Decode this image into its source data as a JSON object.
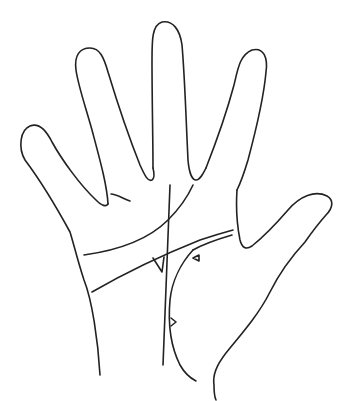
{
  "figure": {
    "title": "Palm lines diagram",
    "width": 347,
    "height": 401,
    "background_color": "#ffffff",
    "stroke_color": "#222222"
  },
  "hand_outline": {
    "little_finger": "M 100 375 C 98 340, 92 300, 84 280 C 78 262, 74 245, 70 232 C 58 210, 40 180, 25 160 C 18 148, 20 130, 30 126 C 40 122, 47 132, 52 142 C 62 160, 80 185, 96 200 C 102 206, 106 207, 108 204",
    "ring_finger": "M 108 204 C 107 185, 100 160, 92 130 C 85 105, 78 85, 76 70 C 74 55, 80 48, 90 48 C 100 48, 104 58, 108 72 C 118 105, 130 140, 140 165 C 145 176, 148 182, 152 180 C 155 178, 154 172, 153 168",
    "middle_finger": "M 153 168 C 153 140, 152 100, 152 60 C 152 40, 152 25, 162 22 C 173 20, 180 30, 182 45 C 185 80, 186 120, 188 160 C 189 172, 192 180, 196 180 C 200 180, 203 174, 206 168",
    "index_finger": "M 206 168 C 215 145, 226 115, 234 85 C 238 68, 240 55, 252 50 C 264 47, 268 58, 266 72 C 264 95, 256 130, 248 160 C 242 180, 238 188, 237 190",
    "thumb": "M 237 190 C 236 205, 237 225, 240 240 C 242 248, 246 250, 252 246 C 262 238, 275 225, 288 210 C 300 196, 315 190, 327 196 C 334 200, 333 208, 326 215 C 318 224, 312 232, 305 242 C 292 256, 280 272, 270 292 C 260 312, 245 330, 230 348 C 220 360, 212 372, 214 385 C 214 392, 215 398, 216 400"
  },
  "palm_lines": {
    "heart_line_crease": "M 111 194 C 116 194, 122 198, 130 201",
    "heart_line": "M 84 255 C 120 250, 150 238, 168 220 C 180 208, 188 196, 193 185",
    "head_line": "M 92 292 C 130 270, 170 252, 200 240 C 212 236, 222 233, 233 230",
    "head_line_second": "M 232 235 C 215 240, 200 246, 193 250",
    "fate_line": "M 170 185 C 168 230, 166 280, 163 365",
    "life_line": "M 193 250 C 182 262, 172 280, 170 300 C 168 322, 170 345, 180 365 C 184 372, 190 378, 196 381"
  },
  "markers": {
    "triangle_left": "M 153 258 L 162 272 L 164 257",
    "triangle_upper_right": "M 193 258 L 199 255 L 199 261 Z",
    "triangle_lower": "M 171 318 L 176 322 L 171 326"
  }
}
